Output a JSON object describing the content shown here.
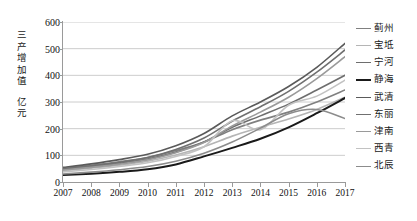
{
  "chart_data": {
    "type": "line",
    "title": "",
    "xlabel": "",
    "ylabel": "三产增加值 亿元",
    "ylabel_lines": [
      "三",
      "产",
      "增",
      "加",
      "值",
      "亿",
      "元"
    ],
    "unit": "亿元",
    "x": [
      2007,
      2008,
      2009,
      2010,
      2011,
      2012,
      2013,
      2014,
      2015,
      2016,
      2017
    ],
    "x_tick_labels": [
      "2007",
      "2008",
      "2009",
      "2010",
      "2011",
      "2012",
      "2013",
      "2014",
      "2015",
      "2016",
      "2017"
    ],
    "y_tick_labels": [
      "0",
      "100",
      "200",
      "300",
      "400",
      "500",
      "600"
    ],
    "y_ticks": [
      0,
      100,
      200,
      300,
      400,
      500,
      600
    ],
    "ylim": [
      0,
      600
    ],
    "grid": true,
    "grid_axis": "y",
    "legend_position": "right",
    "series": [
      {
        "name": "蓟州",
        "color": "#808080",
        "width": 1.6,
        "values": [
          52,
          63,
          76,
          92,
          118,
          150,
          196,
          232,
          262,
          300,
          345
        ]
      },
      {
        "name": "宝坻",
        "color": "#b5b5b5",
        "width": 1.6,
        "values": [
          42,
          52,
          63,
          78,
          101,
          132,
          172,
          205,
          236,
          272,
          318
        ]
      },
      {
        "name": "宁河",
        "color": "#6e6e6e",
        "width": 1.6,
        "values": [
          48,
          58,
          70,
          86,
          112,
          150,
          205,
          248,
          292,
          345,
          400
        ]
      },
      {
        "name": "静海",
        "color": "#1a1a1a",
        "width": 2.0,
        "values": [
          26,
          31,
          38,
          48,
          66,
          96,
          128,
          162,
          205,
          258,
          315
        ]
      },
      {
        "name": "武清",
        "color": "#5a5a5a",
        "width": 1.6,
        "values": [
          55,
          68,
          84,
          104,
          136,
          182,
          248,
          300,
          358,
          430,
          520
        ]
      },
      {
        "name": "东丽",
        "color": "#707070",
        "width": 1.6,
        "values": [
          50,
          61,
          74,
          92,
          122,
          165,
          228,
          282,
          340,
          412,
          495
        ]
      },
      {
        "name": "津南",
        "color": "#9a9a9a",
        "width": 1.6,
        "values": [
          45,
          55,
          67,
          83,
          110,
          148,
          210,
          262,
          318,
          388,
          470
        ]
      },
      {
        "name": "西青",
        "color": "#c2c2c2",
        "width": 1.6,
        "values": [
          38,
          47,
          58,
          72,
          96,
          132,
          230,
          196,
          288,
          322,
          382
        ]
      },
      {
        "name": "北辰",
        "color": "#8c8c8c",
        "width": 1.6,
        "values": [
          30,
          37,
          46,
          58,
          78,
          108,
          150,
          202,
          256,
          272,
          238
        ]
      }
    ]
  }
}
